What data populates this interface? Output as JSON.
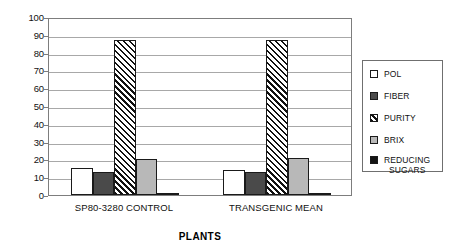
{
  "chart_data": {
    "type": "bar",
    "title": "",
    "xlabel": "PLANTS",
    "ylabel": "",
    "ylim": [
      0,
      100
    ],
    "ytick_step": 10,
    "yticks": [
      "100",
      "90",
      "80",
      "70",
      "60",
      "50",
      "40",
      "30",
      "20",
      "10",
      "0"
    ],
    "grid": true,
    "legend_position": "right",
    "categories": [
      "SP80-3280 CONTROL",
      "TRANSGENIC MEAN"
    ],
    "series": [
      {
        "name": "POL",
        "values": [
          15,
          14
        ],
        "pattern": "solid-white",
        "color": "#ffffff"
      },
      {
        "name": "FIBER",
        "values": [
          13,
          13
        ],
        "pattern": "solid-dark",
        "color": "#4a4a4a"
      },
      {
        "name": "PURITY",
        "values": [
          87,
          87
        ],
        "pattern": "diagonal-hatch",
        "color": "#111111"
      },
      {
        "name": "BRIX",
        "values": [
          20,
          21
        ],
        "pattern": "solid-light",
        "color": "#b8b8b8"
      },
      {
        "name": "REDUCING SUGARS",
        "values": [
          1,
          1
        ],
        "pattern": "solid-black",
        "color": "#151515"
      }
    ]
  },
  "legend": {
    "items": [
      {
        "label": "POL"
      },
      {
        "label": "FIBER"
      },
      {
        "label": "PURITY"
      },
      {
        "label": "BRIX"
      },
      {
        "label": "REDUCING\nSUGARS"
      }
    ]
  }
}
